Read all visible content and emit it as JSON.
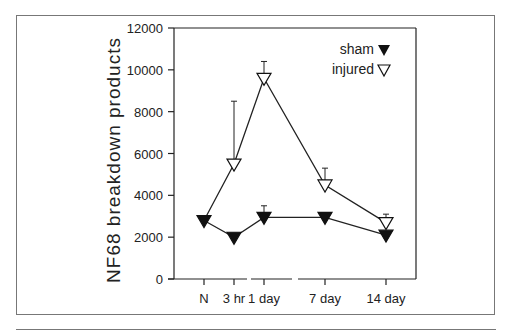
{
  "chart_data": {
    "type": "line",
    "title": "",
    "xlabel": "",
    "ylabel": "NF68 breakdown products",
    "ylim": [
      0,
      12000
    ],
    "yticks": [
      0,
      2000,
      4000,
      6000,
      8000,
      10000,
      12000
    ],
    "categories": [
      "N",
      "3 hr",
      "1 day",
      "7 day",
      "14 day"
    ],
    "grid": false,
    "legend_position": "upper right",
    "x_axis_breaks": [
      "between 3 hr and 1 day",
      "between 1 day and 7 day"
    ],
    "series": [
      {
        "name": "sham",
        "marker": "filled-down-triangle",
        "x": [
          "N",
          "3 hr",
          "1 day",
          "7 day",
          "14 day"
        ],
        "values": [
          2700,
          1900,
          2850,
          2850,
          2000
        ],
        "error_upper": [
          null,
          null,
          3500,
          null,
          null
        ]
      },
      {
        "name": "injured",
        "marker": "open-down-triangle",
        "x": [
          "N",
          "3 hr",
          "1 day",
          "7 day",
          "14 day"
        ],
        "values": [
          2700,
          5400,
          9500,
          4400,
          2600
        ],
        "error_upper": [
          null,
          8500,
          10400,
          5300,
          3100
        ]
      }
    ]
  },
  "labels": {
    "ylabel": "NF68 breakdown products",
    "legend_sham": "sham",
    "legend_injured": "injured",
    "xticks": [
      "N",
      "3 hr",
      "1 day",
      "7 day",
      "14 day"
    ],
    "yticks": [
      "0",
      "2000",
      "4000",
      "6000",
      "8000",
      "10000",
      "12000"
    ]
  }
}
